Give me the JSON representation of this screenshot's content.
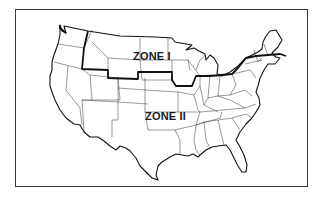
{
  "map": {
    "subject": "Contiguous United States",
    "zones": [
      {
        "id": "zone-1",
        "label": "ZONE I",
        "region": "north"
      },
      {
        "id": "zone-2",
        "label": "ZONE II",
        "region": "south"
      }
    ],
    "colors": {
      "background": "#ffffff",
      "lines": "#111111",
      "frame": "#3a3a3a"
    }
  }
}
